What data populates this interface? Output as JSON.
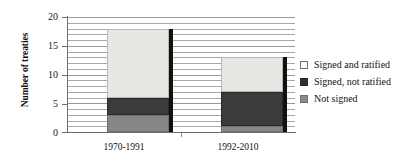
{
  "chart_data": {
    "type": "bar",
    "subtype": "stacked",
    "title": "",
    "xlabel": "",
    "ylabel": "Number of treaties",
    "categories": [
      "1970-1991",
      "1992-2010"
    ],
    "series": [
      {
        "name": "Signed and ratified",
        "values": [
          12,
          6
        ],
        "color": "#e7e7e4"
      },
      {
        "name": "Signed, not ratified",
        "values": [
          3,
          6
        ],
        "color": "#3b3b3b"
      },
      {
        "name": "Not signed",
        "values": [
          3,
          1
        ],
        "color": "#878787"
      }
    ],
    "stack_totals": [
      18,
      13
    ],
    "ylim": [
      0,
      20
    ],
    "y_ticks": [
      0,
      5,
      10,
      15,
      20
    ],
    "y_tick_labels": [
      "0",
      "5",
      "10",
      "15",
      "20"
    ],
    "minor_tick_step": 1,
    "grid": true,
    "grid_orientation": "horizontal",
    "legend_position": "right"
  },
  "legend": {
    "items": [
      {
        "label": "Signed and ratified",
        "swatch": "legend-swatch-ratified"
      },
      {
        "label": "Signed, not ratified",
        "swatch": "legend-swatch-signed"
      },
      {
        "label": "Not signed",
        "swatch": "legend-swatch-notsigned"
      }
    ]
  },
  "axis": {
    "y_title": "Number of treaties",
    "y_labels": [
      "20",
      "15",
      "10",
      "5",
      "0"
    ],
    "x_labels": [
      "1970-1991",
      "1992-2010"
    ]
  }
}
